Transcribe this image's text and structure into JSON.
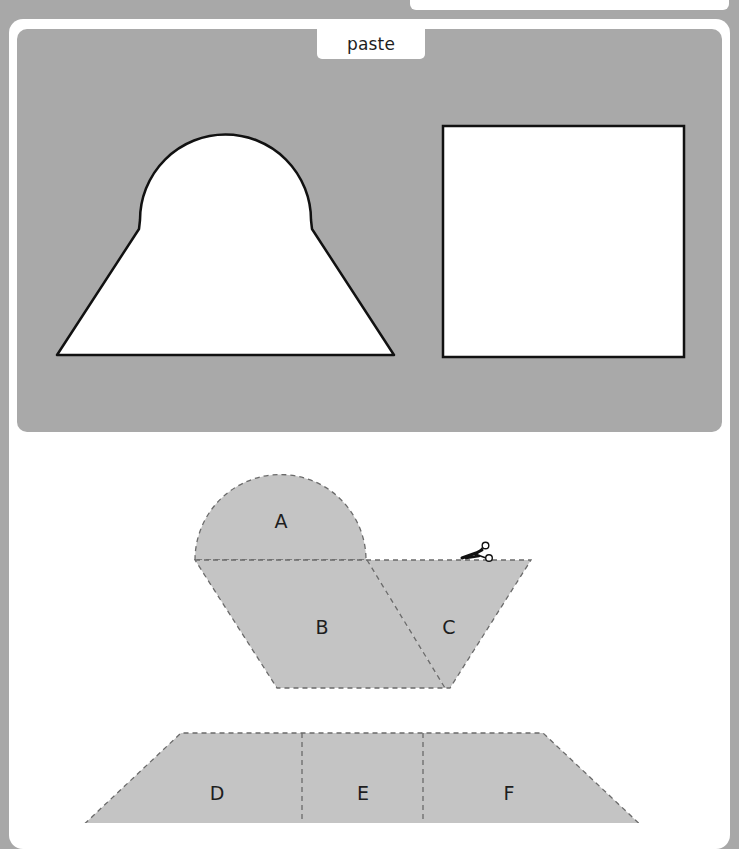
{
  "paste_panel": {
    "tab_label": "paste",
    "background_color": "#a9a9a9",
    "outline_shapes": [
      {
        "name": "arch-trapezoid-outline",
        "description": "semicircle on top of trapezoid"
      },
      {
        "name": "square-outline",
        "description": "square"
      }
    ]
  },
  "cut_pieces": {
    "fill_color": "#c4c4c4",
    "dash_color": "#6a6a6a",
    "upper_group": {
      "pieces": [
        {
          "label": "A",
          "shape": "semicircle"
        },
        {
          "label": "B",
          "shape": "trapezoid"
        },
        {
          "label": "C",
          "shape": "triangle"
        }
      ],
      "icon": "scissors-icon"
    },
    "lower_group": {
      "pieces": [
        {
          "label": "D",
          "shape": "trapezoid-left"
        },
        {
          "label": "E",
          "shape": "rectangle"
        },
        {
          "label": "F",
          "shape": "trapezoid-right"
        }
      ]
    }
  }
}
